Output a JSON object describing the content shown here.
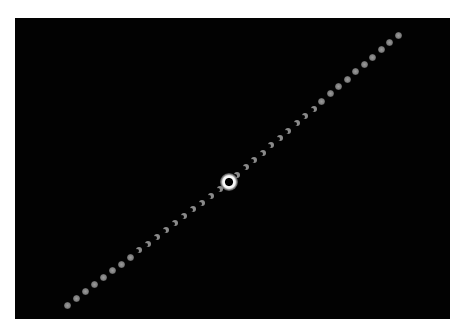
{
  "image": {
    "subject": "solar-eclipse-time-lapse-sequence",
    "frame": {
      "x": 15,
      "y": 18,
      "width": 435,
      "height": 301,
      "background": "#020202"
    },
    "totality": {
      "x": 229,
      "y": 182,
      "diameter": 18,
      "color": "#ffffff"
    },
    "sequence_start": {
      "x": 67,
      "y": 305
    },
    "sequence_end": {
      "x": 398,
      "y": 35
    },
    "bead_count_before_totality": 18,
    "bead_count_after_totality": 20,
    "bead_color": "#8a8a8a"
  },
  "caption": {
    "text": ""
  },
  "top_note": {
    "text": ""
  }
}
